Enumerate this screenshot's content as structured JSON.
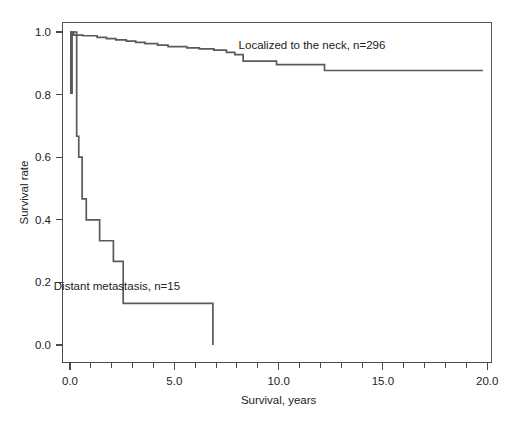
{
  "chart_data": {
    "type": "line",
    "subtype": "kaplan-meier-step",
    "title": "",
    "xlabel": "Survival, years",
    "ylabel": "Survival rate",
    "xlim": [
      -0.6,
      20.9
    ],
    "ylim": [
      -0.035,
      1.05
    ],
    "grid": false,
    "legend_position": "inline-annotation",
    "x_ticks_major": [
      "0.0",
      "5.0",
      "10.0",
      "15.0",
      "20.0"
    ],
    "x_ticks_major_values": [
      0,
      5,
      10,
      15,
      20
    ],
    "x_ticks_minor_values": [
      1,
      2,
      3,
      4,
      6,
      7,
      8,
      9,
      11,
      12,
      13,
      14,
      16,
      17,
      18,
      19
    ],
    "y_ticks_major": [
      "1.0",
      "0.8",
      "0.6",
      "0.4",
      "0.2",
      "0.0"
    ],
    "y_ticks_major_values": [
      1.0,
      0.8,
      0.6,
      0.4,
      0.2,
      0.0
    ],
    "series": [
      {
        "name": "Localized to the neck, n=296",
        "n": 296,
        "label": "Localized to the neck, n=296",
        "color": "#5a5a5a",
        "annotation_x": 11.6,
        "annotation_y": 0.945,
        "points": [
          [
            0.0,
            1.0
          ],
          [
            0.04,
            1.0
          ],
          [
            0.04,
            0.805
          ],
          [
            0.1,
            0.805
          ],
          [
            0.1,
            1.0
          ],
          [
            0.18,
            1.0
          ],
          [
            0.18,
            0.99
          ],
          [
            0.62,
            0.99
          ],
          [
            0.62,
            0.988
          ],
          [
            1.3,
            0.988
          ],
          [
            1.3,
            0.983
          ],
          [
            1.75,
            0.983
          ],
          [
            1.75,
            0.979
          ],
          [
            2.2,
            0.979
          ],
          [
            2.2,
            0.975
          ],
          [
            2.7,
            0.975
          ],
          [
            2.7,
            0.971
          ],
          [
            3.15,
            0.971
          ],
          [
            3.15,
            0.967
          ],
          [
            3.6,
            0.967
          ],
          [
            3.6,
            0.963
          ],
          [
            4.2,
            0.963
          ],
          [
            4.2,
            0.958
          ],
          [
            4.7,
            0.958
          ],
          [
            4.7,
            0.953
          ],
          [
            5.6,
            0.953
          ],
          [
            5.6,
            0.949
          ],
          [
            6.2,
            0.949
          ],
          [
            6.2,
            0.946
          ],
          [
            6.9,
            0.946
          ],
          [
            6.9,
            0.942
          ],
          [
            7.5,
            0.942
          ],
          [
            7.5,
            0.935
          ],
          [
            7.9,
            0.935
          ],
          [
            7.9,
            0.928
          ],
          [
            8.3,
            0.928
          ],
          [
            8.3,
            0.907
          ],
          [
            9.9,
            0.907
          ],
          [
            9.9,
            0.896
          ],
          [
            12.2,
            0.896
          ],
          [
            12.2,
            0.877
          ],
          [
            19.8,
            0.877
          ]
        ]
      },
      {
        "name": "Distant metastasis, n=15",
        "n": 15,
        "label": "Distant metastasis, n=15",
        "color": "#5a5a5a",
        "annotation_x": 2.25,
        "annotation_y": 0.175,
        "points": [
          [
            0.0,
            1.0
          ],
          [
            0.32,
            1.0
          ],
          [
            0.32,
            0.667
          ],
          [
            0.42,
            0.667
          ],
          [
            0.42,
            0.6
          ],
          [
            0.58,
            0.6
          ],
          [
            0.58,
            0.467
          ],
          [
            0.78,
            0.467
          ],
          [
            0.78,
            0.4
          ],
          [
            1.42,
            0.4
          ],
          [
            1.42,
            0.333
          ],
          [
            2.08,
            0.333
          ],
          [
            2.08,
            0.267
          ],
          [
            2.55,
            0.267
          ],
          [
            2.55,
            0.133
          ],
          [
            6.85,
            0.133
          ],
          [
            6.85,
            0.0
          ]
        ]
      }
    ]
  },
  "annotations": {
    "localized": "Localized to the neck, n=296",
    "distant": "Distant metastasis, n=15"
  },
  "axes": {
    "x_title": "Survival, years",
    "y_title": "Survival rate",
    "x_tick_labels": [
      "0.0",
      "5.0",
      "10.0",
      "15.0",
      "20.0"
    ],
    "y_tick_labels": [
      "1.0",
      "0.8",
      "0.6",
      "0.4",
      "0.2",
      "0.0"
    ]
  },
  "colors": {
    "curve": "#5a5a5a",
    "axis": "#4a4a4a",
    "frame": "#555555",
    "text": "#222222",
    "background": "#ffffff"
  }
}
